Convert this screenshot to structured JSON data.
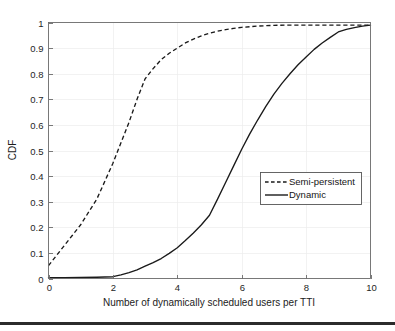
{
  "figure": {
    "background_color": "#ffffff",
    "frame_color": "#6b6b6b",
    "series_color": "#1a1a1a",
    "grid_color": "#ededed"
  },
  "chart_data": {
    "type": "line",
    "title": "",
    "subtitle": "",
    "xlabel": "Number of dynamically scheduled users per TTI",
    "ylabel": "CDF",
    "xlim": [
      0,
      10
    ],
    "ylim": [
      0,
      1
    ],
    "xticks": [
      0,
      2,
      4,
      6,
      8,
      10
    ],
    "xticklabels": [
      "0",
      "2",
      "4",
      "6",
      "8",
      "10"
    ],
    "yticks": [
      0,
      0.1,
      0.2,
      0.3,
      0.4,
      0.5,
      0.6,
      0.7,
      0.8,
      0.9,
      1
    ],
    "yticklabels": [
      "0",
      "0.1",
      "0.2",
      "0.3",
      "0.4",
      "0.5",
      "0.6",
      "0.7",
      "0.8",
      "0.9",
      "1"
    ],
    "grid": true,
    "legend_position": "center-right",
    "series": [
      {
        "name": "Semi-persistent",
        "style": "dashed",
        "color": "#1a1a1a",
        "x": [
          0,
          0.25,
          0.5,
          0.75,
          1,
          1.25,
          1.5,
          1.75,
          2,
          2.25,
          2.5,
          2.75,
          3,
          3.25,
          3.5,
          3.75,
          4,
          4.25,
          4.5,
          4.75,
          5,
          5.25,
          5.5,
          5.75,
          6,
          6.5,
          7,
          7.5,
          8,
          8.5,
          9,
          9.5,
          10
        ],
        "y": [
          0.05,
          0.09,
          0.13,
          0.17,
          0.21,
          0.26,
          0.31,
          0.38,
          0.45,
          0.53,
          0.61,
          0.7,
          0.78,
          0.82,
          0.855,
          0.88,
          0.9,
          0.92,
          0.935,
          0.948,
          0.958,
          0.966,
          0.972,
          0.977,
          0.981,
          0.986,
          0.989,
          0.99,
          0.99,
          0.99,
          0.99,
          0.99,
          0.99
        ]
      },
      {
        "name": "Dynamic",
        "style": "solid",
        "color": "#1a1a1a",
        "x": [
          0,
          0.5,
          1,
          1.5,
          2,
          2.25,
          2.5,
          2.75,
          3,
          3.25,
          3.5,
          3.75,
          4,
          4.25,
          4.5,
          4.75,
          5,
          5.25,
          5.5,
          5.75,
          6,
          6.25,
          6.5,
          6.75,
          7,
          7.25,
          7.5,
          7.75,
          8,
          8.25,
          8.5,
          8.75,
          9,
          9.25,
          9.5,
          9.75,
          10
        ],
        "y": [
          0.003,
          0.003,
          0.004,
          0.005,
          0.007,
          0.014,
          0.023,
          0.034,
          0.048,
          0.062,
          0.078,
          0.098,
          0.12,
          0.148,
          0.178,
          0.21,
          0.247,
          0.31,
          0.375,
          0.44,
          0.505,
          0.565,
          0.62,
          0.672,
          0.72,
          0.762,
          0.8,
          0.835,
          0.865,
          0.895,
          0.92,
          0.942,
          0.963,
          0.973,
          0.98,
          0.986,
          0.99
        ]
      }
    ]
  },
  "legend": {
    "entries": [
      {
        "label": "Semi-persistent",
        "style": "dashed"
      },
      {
        "label": "Dynamic",
        "style": "solid"
      }
    ]
  }
}
